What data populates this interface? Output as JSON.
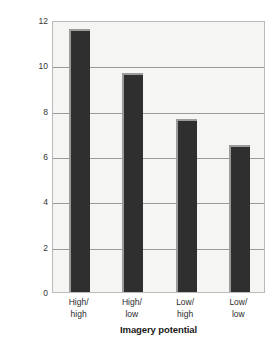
{
  "chart_data": {
    "type": "bar",
    "title": "",
    "subtitle": "",
    "categories": [
      "High/\nhigh",
      "High/\nlow",
      "Low/\nhigh",
      "Low/\nlow"
    ],
    "category_lines": [
      [
        "High/",
        "high"
      ],
      [
        "High/",
        "low"
      ],
      [
        "Low/",
        "high"
      ],
      [
        "Low/",
        "low"
      ]
    ],
    "values": [
      11.6,
      9.65,
      7.65,
      6.5
    ],
    "xlabel": "Imagery potential",
    "ylabel": "Average number of pairs recalled",
    "ylim": [
      0,
      12
    ],
    "yticks": [
      0,
      2,
      4,
      6,
      8,
      10,
      12
    ],
    "ytick_labels": [
      "0",
      "2",
      "4",
      "6",
      "8",
      "10",
      "12"
    ],
    "grid": true,
    "grid_axis": "y",
    "legend": false,
    "legend_position": "none",
    "bar_color": "#2f2f2f",
    "bar_bevel_color": "#9b9b9b",
    "plot_background": "#f5f5f3",
    "gridline_color": "#9a9a96",
    "axis_border_color": "#b9b9b5",
    "page_background": "#ffffff"
  }
}
